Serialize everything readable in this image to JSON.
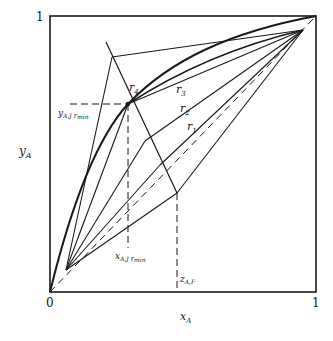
{
  "figure": {
    "axis": {
      "x_label": "x",
      "x_label_sub": "A",
      "y_label": "y",
      "y_label_sub": "A",
      "origin_label": "0",
      "x_max_label": "1",
      "y_max_label": "1"
    },
    "labels": {
      "r1": "r",
      "r1_sub": "1",
      "r2": "r",
      "r2_sub": "2",
      "r3": "r",
      "r3_sub": "3",
      "r4": "r",
      "r4_sub": "4",
      "y_min": "y",
      "y_min_sub": "A,J",
      "y_min_sub2": "r",
      "y_min_sub3": "min",
      "x_min": "x",
      "x_min_sub": "A,J",
      "x_min_sub2": "r",
      "x_min_sub3": "min",
      "z_feed": "z",
      "z_feed_sub": "A,F"
    },
    "colors": {
      "ink": "#1a1a1a",
      "background": "#ffffff"
    }
  }
}
